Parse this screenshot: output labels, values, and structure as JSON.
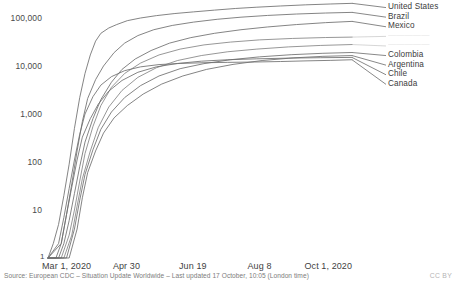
{
  "chart_data": {
    "type": "line",
    "title": "",
    "subtitle": "",
    "xlabel": "",
    "ylabel": "",
    "yscale": "log",
    "ylim": [
      1,
      300000
    ],
    "grid": false,
    "legend_position": "right",
    "y_ticks": [
      "1",
      "10",
      "100",
      "1,000",
      "10,000",
      "100,000"
    ],
    "y_tick_values": [
      1,
      10,
      100,
      1000,
      10000,
      100000
    ],
    "x_ticks": [
      "Mar 1, 2020",
      "Apr 30",
      "Jun 19",
      "Aug 8",
      "Oct 1, 2020"
    ],
    "x_tick_days": [
      0,
      60,
      110,
      160,
      214
    ],
    "x_range_days": [
      0,
      230
    ],
    "series": [
      {
        "name": "United States",
        "end_value": 200000,
        "points": [
          [
            0,
            1
          ],
          [
            4,
            2
          ],
          [
            8,
            5
          ],
          [
            12,
            20
          ],
          [
            16,
            90
          ],
          [
            20,
            500
          ],
          [
            24,
            2200
          ],
          [
            28,
            7000
          ],
          [
            32,
            17000
          ],
          [
            36,
            33000
          ],
          [
            40,
            48000
          ],
          [
            46,
            62000
          ],
          [
            52,
            73000
          ],
          [
            60,
            88000
          ],
          [
            70,
            100000
          ],
          [
            82,
            112000
          ],
          [
            96,
            124000
          ],
          [
            110,
            134000
          ],
          [
            126,
            146000
          ],
          [
            142,
            158000
          ],
          [
            158,
            168000
          ],
          [
            176,
            178000
          ],
          [
            195,
            188000
          ],
          [
            214,
            196000
          ],
          [
            230,
            202000
          ]
        ]
      },
      {
        "name": "Brazil",
        "end_value": 130000,
        "points": [
          [
            0,
            1
          ],
          [
            6,
            1
          ],
          [
            10,
            2
          ],
          [
            14,
            8
          ],
          [
            18,
            35
          ],
          [
            22,
            170
          ],
          [
            26,
            700
          ],
          [
            30,
            2100
          ],
          [
            36,
            5200
          ],
          [
            42,
            10000
          ],
          [
            50,
            19000
          ],
          [
            58,
            30000
          ],
          [
            68,
            43000
          ],
          [
            80,
            57000
          ],
          [
            94,
            70000
          ],
          [
            110,
            82000
          ],
          [
            128,
            94000
          ],
          [
            146,
            104000
          ],
          [
            166,
            113000
          ],
          [
            188,
            121000
          ],
          [
            210,
            127000
          ],
          [
            230,
            131000
          ]
        ]
      },
      {
        "name": "Mexico",
        "end_value": 85000,
        "points": [
          [
            0,
            1
          ],
          [
            8,
            1
          ],
          [
            12,
            2
          ],
          [
            16,
            6
          ],
          [
            20,
            22
          ],
          [
            24,
            80
          ],
          [
            28,
            260
          ],
          [
            34,
            800
          ],
          [
            40,
            2000
          ],
          [
            48,
            4600
          ],
          [
            56,
            8500
          ],
          [
            66,
            14000
          ],
          [
            78,
            21000
          ],
          [
            92,
            30000
          ],
          [
            108,
            39000
          ],
          [
            126,
            48000
          ],
          [
            146,
            57000
          ],
          [
            166,
            65000
          ],
          [
            188,
            73000
          ],
          [
            210,
            80000
          ],
          [
            230,
            85000
          ]
        ]
      },
      {
        "name": "",
        "end_value": 40000,
        "faded": true,
        "points": [
          [
            0,
            1
          ],
          [
            10,
            1
          ],
          [
            16,
            3
          ],
          [
            20,
            10
          ],
          [
            24,
            40
          ],
          [
            28,
            150
          ],
          [
            34,
            550
          ],
          [
            40,
            1500
          ],
          [
            48,
            3600
          ],
          [
            58,
            7000
          ],
          [
            70,
            11500
          ],
          [
            84,
            17000
          ],
          [
            100,
            22500
          ],
          [
            118,
            27500
          ],
          [
            138,
            31500
          ],
          [
            160,
            35000
          ],
          [
            185,
            37500
          ],
          [
            210,
            39200
          ],
          [
            230,
            40000
          ]
        ]
      },
      {
        "name": "",
        "end_value": 28000,
        "faded": true,
        "points": [
          [
            0,
            1
          ],
          [
            12,
            1
          ],
          [
            18,
            3
          ],
          [
            22,
            12
          ],
          [
            26,
            45
          ],
          [
            32,
            170
          ],
          [
            38,
            520
          ],
          [
            46,
            1400
          ],
          [
            56,
            3100
          ],
          [
            68,
            5800
          ],
          [
            82,
            9200
          ],
          [
            98,
            13000
          ],
          [
            116,
            16500
          ],
          [
            136,
            19800
          ],
          [
            158,
            22500
          ],
          [
            182,
            25000
          ],
          [
            206,
            26800
          ],
          [
            230,
            28000
          ]
        ]
      },
      {
        "name": "Colombia",
        "end_value": 19000,
        "points": [
          [
            0,
            1
          ],
          [
            14,
            1
          ],
          [
            20,
            4
          ],
          [
            24,
            16
          ],
          [
            28,
            55
          ],
          [
            34,
            180
          ],
          [
            40,
            480
          ],
          [
            48,
            1100
          ],
          [
            58,
            2200
          ],
          [
            70,
            3900
          ],
          [
            84,
            6200
          ],
          [
            100,
            8800
          ],
          [
            118,
            11200
          ],
          [
            138,
            13500
          ],
          [
            160,
            15500
          ],
          [
            184,
            17200
          ],
          [
            208,
            18400
          ],
          [
            230,
            19100
          ]
        ]
      },
      {
        "name": "Argentina",
        "end_value": 16500,
        "points": [
          [
            0,
            1
          ],
          [
            16,
            1
          ],
          [
            22,
            4
          ],
          [
            26,
            18
          ],
          [
            30,
            60
          ],
          [
            36,
            170
          ],
          [
            42,
            400
          ],
          [
            50,
            830
          ],
          [
            60,
            1500
          ],
          [
            72,
            2600
          ],
          [
            86,
            4200
          ],
          [
            102,
            6200
          ],
          [
            120,
            8500
          ],
          [
            140,
            10800
          ],
          [
            162,
            13000
          ],
          [
            186,
            14800
          ],
          [
            208,
            15900
          ],
          [
            230,
            16500
          ]
        ]
      },
      {
        "name": "Chile",
        "end_value": 15000,
        "points": [
          [
            0,
            1
          ],
          [
            10,
            2
          ],
          [
            14,
            8
          ],
          [
            18,
            30
          ],
          [
            22,
            110
          ],
          [
            26,
            330
          ],
          [
            32,
            800
          ],
          [
            38,
            1600
          ],
          [
            46,
            3000
          ],
          [
            56,
            5000
          ],
          [
            68,
            7400
          ],
          [
            82,
            9600
          ],
          [
            98,
            11300
          ],
          [
            116,
            12600
          ],
          [
            136,
            13500
          ],
          [
            158,
            14100
          ],
          [
            182,
            14600
          ],
          [
            206,
            14900
          ],
          [
            230,
            15100
          ]
        ]
      },
      {
        "name": "Canada",
        "end_value": 13500,
        "points": [
          [
            0,
            1
          ],
          [
            8,
            2
          ],
          [
            12,
            7
          ],
          [
            16,
            28
          ],
          [
            20,
            110
          ],
          [
            24,
            380
          ],
          [
            28,
            1000
          ],
          [
            34,
            2300
          ],
          [
            40,
            4000
          ],
          [
            48,
            6000
          ],
          [
            58,
            8000
          ],
          [
            70,
            9600
          ],
          [
            84,
            10700
          ],
          [
            100,
            11300
          ],
          [
            118,
            11700
          ],
          [
            136,
            11900
          ],
          [
            156,
            12100
          ],
          [
            176,
            12400
          ],
          [
            196,
            12800
          ],
          [
            214,
            13100
          ],
          [
            230,
            13500
          ]
        ]
      }
    ],
    "legend_entries": [
      {
        "label": "United States",
        "faded": false
      },
      {
        "label": "Brazil",
        "faded": false
      },
      {
        "label": "Mexico",
        "faded": false
      },
      {
        "label": "",
        "faded": true
      },
      {
        "label": "",
        "faded": true
      },
      {
        "label": "Colombia",
        "faded": false
      },
      {
        "label": "Argentina",
        "faded": false
      },
      {
        "label": "Chile",
        "faded": false
      },
      {
        "label": "Canada",
        "faded": false
      }
    ]
  },
  "footer": {
    "source": "Source: European CDC – Situation Update Worldwide – Last updated 17 October, 10:05 (London time)",
    "license": "CC BY"
  },
  "axis": {
    "origin_label": "1"
  },
  "colors": {
    "line": "#6e6e6e",
    "text": "#3c3c3c",
    "muted": "#7d7d7d",
    "faded": "#cfcfcf"
  }
}
